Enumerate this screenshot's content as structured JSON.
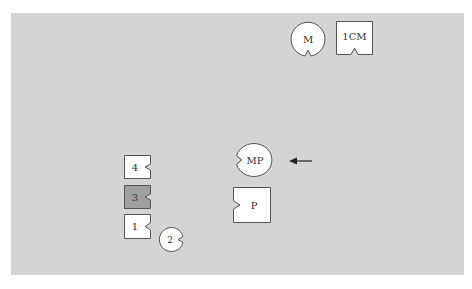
{
  "colors": {
    "background": "#ffffff",
    "panel": "#d4d4d4",
    "shape_fill": "#ffffff",
    "shape_fill_dark": "#a0a0a0",
    "stroke": "#555555"
  },
  "shapes": {
    "m": {
      "label": "M",
      "type": "circle-notch-bottom"
    },
    "icm": {
      "label": "1CM",
      "type": "square-notch-bottom"
    },
    "mp": {
      "label": "MP",
      "type": "circle-notch-left"
    },
    "p": {
      "label": "P",
      "type": "square-notch-left"
    },
    "block4": {
      "label": "4",
      "type": "square-notch-right"
    },
    "block3": {
      "label": "3",
      "type": "square-notch-right",
      "shaded": true
    },
    "block1": {
      "label": "1",
      "type": "square-notch-right"
    },
    "circle2": {
      "label": "2",
      "type": "circle-notch-right"
    }
  },
  "arrow": {
    "direction": "left",
    "points_to": "MP"
  }
}
